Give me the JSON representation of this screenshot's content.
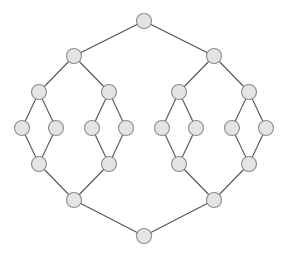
{
  "diagram": {
    "type": "lattice-graph",
    "style": {
      "node_fill": "#e4e4e4",
      "node_stroke": "#8a8a8a",
      "edge_color": "#555555",
      "node_radius": 7.5,
      "background": "#ffffff"
    },
    "nodes": [
      {
        "id": "n0",
        "x": 144,
        "y": 21
      },
      {
        "id": "n1",
        "x": 74,
        "y": 56
      },
      {
        "id": "n2",
        "x": 214,
        "y": 56
      },
      {
        "id": "n3",
        "x": 39,
        "y": 92
      },
      {
        "id": "n4",
        "x": 109,
        "y": 92
      },
      {
        "id": "n5",
        "x": 179,
        "y": 92
      },
      {
        "id": "n6",
        "x": 249,
        "y": 92
      },
      {
        "id": "n7",
        "x": 22,
        "y": 128
      },
      {
        "id": "n8",
        "x": 56,
        "y": 128
      },
      {
        "id": "n9",
        "x": 92,
        "y": 128
      },
      {
        "id": "n10",
        "x": 126,
        "y": 128
      },
      {
        "id": "n11",
        "x": 162,
        "y": 128
      },
      {
        "id": "n12",
        "x": 196,
        "y": 128
      },
      {
        "id": "n13",
        "x": 232,
        "y": 128
      },
      {
        "id": "n14",
        "x": 266,
        "y": 128
      },
      {
        "id": "n15",
        "x": 39,
        "y": 164
      },
      {
        "id": "n16",
        "x": 109,
        "y": 164
      },
      {
        "id": "n17",
        "x": 179,
        "y": 164
      },
      {
        "id": "n18",
        "x": 249,
        "y": 164
      },
      {
        "id": "n19",
        "x": 74,
        "y": 200
      },
      {
        "id": "n20",
        "x": 214,
        "y": 200
      },
      {
        "id": "n21",
        "x": 144,
        "y": 236
      }
    ],
    "edges": [
      [
        "n0",
        "n1"
      ],
      [
        "n0",
        "n2"
      ],
      [
        "n1",
        "n3"
      ],
      [
        "n1",
        "n4"
      ],
      [
        "n2",
        "n5"
      ],
      [
        "n2",
        "n6"
      ],
      [
        "n3",
        "n7"
      ],
      [
        "n3",
        "n8"
      ],
      [
        "n4",
        "n9"
      ],
      [
        "n4",
        "n10"
      ],
      [
        "n5",
        "n11"
      ],
      [
        "n5",
        "n12"
      ],
      [
        "n6",
        "n13"
      ],
      [
        "n6",
        "n14"
      ],
      [
        "n7",
        "n15"
      ],
      [
        "n8",
        "n15"
      ],
      [
        "n9",
        "n16"
      ],
      [
        "n10",
        "n16"
      ],
      [
        "n11",
        "n17"
      ],
      [
        "n12",
        "n17"
      ],
      [
        "n13",
        "n18"
      ],
      [
        "n14",
        "n18"
      ],
      [
        "n15",
        "n19"
      ],
      [
        "n16",
        "n19"
      ],
      [
        "n17",
        "n20"
      ],
      [
        "n18",
        "n20"
      ],
      [
        "n19",
        "n21"
      ],
      [
        "n20",
        "n21"
      ]
    ]
  }
}
